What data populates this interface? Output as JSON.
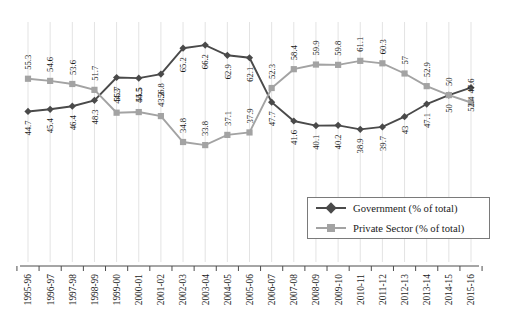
{
  "chart_data": {
    "type": "line",
    "title": "",
    "subtitle": "",
    "xlabel": "",
    "ylabel": "",
    "ylim": [
      30,
      70
    ],
    "grid": "vertical-only",
    "legend_position": "inside-bottom-right",
    "data_labels": true,
    "data_label_rotation": -90,
    "x_tick_rotation": -90,
    "categories": [
      "1995-96",
      "1996-97",
      "1997-98",
      "1998-99",
      "1999-00",
      "2000-01",
      "2001-02",
      "2002-03",
      "2003-04",
      "2004-05",
      "2005-06",
      "2006-07",
      "2007-08",
      "2008-09",
      "2009-10",
      "2010-11",
      "2011-12",
      "2012-13",
      "2013-14",
      "2014-15",
      "2015-16"
    ],
    "series": [
      {
        "name": "Government (% of total)",
        "color": "#4a4a4a",
        "marker": "diamond",
        "values": [
          44.7,
          45.4,
          46.4,
          48.3,
          55.7,
          55.5,
          56.8,
          65.2,
          66.2,
          62.9,
          62.1,
          47.7,
          41.6,
          40.1,
          40.2,
          38.9,
          39.7,
          43,
          47.1,
          50,
          52.4
        ],
        "labels": [
          "44.7",
          "45.4",
          "46.4",
          "48.3",
          "55.7",
          "55.5",
          "56.8",
          "65.2",
          "66.2",
          "62.9",
          "62.1",
          "47.7",
          "41.6",
          "40.1",
          "40.2",
          "38.9",
          "39.7",
          "43",
          "47.1",
          "50",
          "52.4"
        ]
      },
      {
        "name": "Private Sector (% of total)",
        "color": "#a3a3a3",
        "marker": "square",
        "values": [
          55.3,
          54.6,
          53.6,
          51.7,
          44.3,
          44.5,
          43.2,
          34.8,
          33.8,
          37.1,
          37.9,
          52.3,
          58.4,
          59.9,
          59.8,
          61.1,
          60.3,
          57,
          52.9,
          50,
          47.6
        ],
        "labels": [
          "55.3",
          "54.6",
          "53.6",
          "51.7",
          "44.3",
          "44.5",
          "43.2",
          "34.8",
          "33.8",
          "37.1",
          "37.9",
          "52.3",
          "58.4",
          "59.9",
          "59.8",
          "61.1",
          "60.3",
          "57",
          "52.9",
          "50",
          "47.6"
        ]
      }
    ]
  },
  "legend": {
    "items": [
      {
        "label": "Government (% of total)",
        "color": "#4a4a4a",
        "marker": "diamond"
      },
      {
        "label": "Private Sector (% of total)",
        "color": "#a3a3a3",
        "marker": "square"
      }
    ]
  },
  "colors": {
    "government": "#4a4a4a",
    "private_sector": "#a3a3a3",
    "gridline": "#e3e3e3",
    "axis": "#4d4d4d",
    "text": "#1a1a1a",
    "background": "#ffffff"
  }
}
